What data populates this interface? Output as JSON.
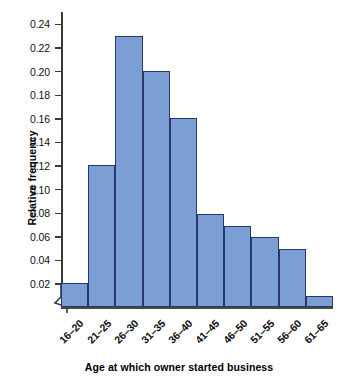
{
  "chart_data": {
    "type": "bar",
    "title": "",
    "xlabel": "Age at which owner started business",
    "ylabel": "Relative frequency",
    "categories": [
      "16–20",
      "21–25",
      "26–30",
      "31–35",
      "36–40",
      "41–45",
      "46–50",
      "51–55",
      "56–60",
      "61–65"
    ],
    "values": [
      0.02,
      0.12,
      0.23,
      0.2,
      0.16,
      0.079,
      0.069,
      0.059,
      0.049,
      0.009
    ],
    "ylim": [
      0,
      0.25
    ],
    "ytick_labels": [
      "0.24",
      "0.22",
      "0.20",
      "0.18",
      "0.16",
      "0.14",
      "0.12",
      "0.10",
      "0.08",
      "0.06",
      "0.04",
      "0.02"
    ],
    "ytick_values": [
      0.24,
      0.22,
      0.2,
      0.18,
      0.16,
      0.14,
      0.12,
      0.1,
      0.08,
      0.06,
      0.04,
      0.02
    ],
    "grid": false,
    "legend": "none",
    "bar_fill_color": "#7b9fd4",
    "bar_border_color": "#27396b",
    "axis_color": "#3a3a3a",
    "axis_break": "zigzag-y-origin"
  }
}
